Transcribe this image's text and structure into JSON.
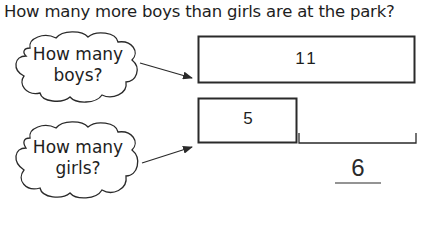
{
  "question": "How many more boys than girls are at the park?",
  "clouds": [
    {
      "line1": "How many",
      "line2": "boys?"
    },
    {
      "line1": "How many",
      "line2": "girls?"
    }
  ],
  "bars": {
    "boys_value": "11",
    "girls_value": "5"
  },
  "answer": {
    "value": "6"
  },
  "colors": {
    "stroke": "#2a2a2a",
    "background": "#ffffff"
  }
}
